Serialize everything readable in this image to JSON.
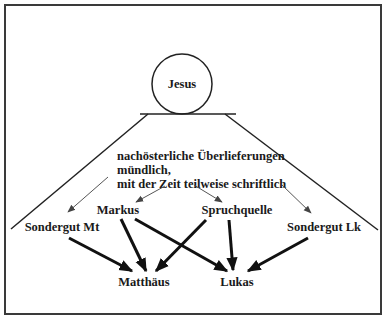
{
  "diagram": {
    "top_node": "Jesus",
    "tradition_text": {
      "line1": "nachösterliche Überlieferungen",
      "line2": "mündlich,",
      "line3": "mit der Zeit teilweise schriftlich"
    },
    "sources": {
      "sondergut_mt": "Sondergut Mt",
      "markus": "Markus",
      "spruchquelle": "Spruchquelle",
      "sondergut_lk": "Sondergut Lk"
    },
    "gospels": {
      "matthaeus": "Matthäus",
      "lukas": "Lukas"
    },
    "edges": [
      {
        "from": "tradition",
        "to": "Sondergut Mt",
        "style": "thin"
      },
      {
        "from": "tradition",
        "to": "Markus",
        "style": "thin"
      },
      {
        "from": "tradition",
        "to": "Spruchquelle",
        "style": "thin"
      },
      {
        "from": "tradition",
        "to": "Sondergut Lk",
        "style": "thin"
      },
      {
        "from": "Sondergut Mt",
        "to": "Matthäus",
        "style": "thick"
      },
      {
        "from": "Markus",
        "to": "Matthäus",
        "style": "thick"
      },
      {
        "from": "Markus",
        "to": "Lukas",
        "style": "thick"
      },
      {
        "from": "Spruchquelle",
        "to": "Matthäus",
        "style": "thick"
      },
      {
        "from": "Spruchquelle",
        "to": "Lukas",
        "style": "thick"
      },
      {
        "from": "Sondergut Lk",
        "to": "Lukas",
        "style": "thick"
      }
    ]
  }
}
